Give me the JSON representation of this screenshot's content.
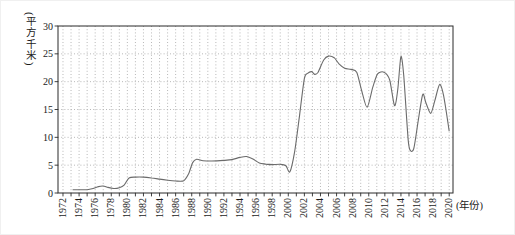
{
  "figure": {
    "ylabel": "(平方千米)",
    "xlabel": "(年份)"
  },
  "colors": {
    "background": "#ffffff",
    "axis": "#2b2b2b",
    "grid": "#b0b0b0",
    "text": "#1a1a1a",
    "line": "#6b6b6b"
  },
  "chart_data": {
    "type": "line",
    "title": "",
    "xlabel": "(年份)",
    "ylabel": "(平方千米)",
    "legend_position": "none",
    "grid": {
      "style": "dotted",
      "vertical_every_years": 1,
      "horizontal_every": 5
    },
    "xlim": [
      1971.38,
      2020.47
    ],
    "ylim": [
      0,
      30
    ],
    "y_ticks": [
      0,
      5,
      10,
      15,
      20,
      25,
      30
    ],
    "x_tick_years_start": 1972,
    "x_tick_years_end": 2020,
    "x_tick_label_step": 2,
    "x_tick_labels": [
      "1972",
      "1974",
      "1976",
      "1978",
      "1980",
      "1982",
      "1984",
      "1986",
      "1988",
      "1990",
      "1992",
      "1994",
      "1996",
      "1998",
      "2000",
      "2002",
      "2004",
      "2006",
      "2008",
      "2010",
      "2012",
      "2014",
      "2016",
      "2018",
      "2020"
    ],
    "points": [
      [
        1973.2,
        0.6
      ],
      [
        1974,
        0.6
      ],
      [
        1975,
        0.6
      ],
      [
        1975.6,
        0.75
      ],
      [
        1976.4,
        1.15
      ],
      [
        1977,
        1.25
      ],
      [
        1977.6,
        1.0
      ],
      [
        1978.3,
        0.8
      ],
      [
        1979,
        0.95
      ],
      [
        1979.6,
        1.4
      ],
      [
        1980.2,
        2.7
      ],
      [
        1981,
        2.85
      ],
      [
        1982,
        2.85
      ],
      [
        1983,
        2.7
      ],
      [
        1984,
        2.5
      ],
      [
        1985,
        2.3
      ],
      [
        1986,
        2.15
      ],
      [
        1987,
        2.2
      ],
      [
        1987.6,
        3.4
      ],
      [
        1988.1,
        5.4
      ],
      [
        1988.6,
        6.05
      ],
      [
        1989.4,
        5.8
      ],
      [
        1990.5,
        5.75
      ],
      [
        1992,
        5.85
      ],
      [
        1993,
        6.0
      ],
      [
        1994,
        6.4
      ],
      [
        1994.8,
        6.55
      ],
      [
        1995.6,
        6.1
      ],
      [
        1996.4,
        5.4
      ],
      [
        1997.2,
        5.2
      ],
      [
        1998,
        5.1
      ],
      [
        1999,
        5.15
      ],
      [
        1999.7,
        4.9
      ],
      [
        2000.2,
        3.8
      ],
      [
        2000.8,
        7.5
      ],
      [
        2001.4,
        14.0
      ],
      [
        2002,
        20.6
      ],
      [
        2002.4,
        21.5
      ],
      [
        2002.9,
        21.8
      ],
      [
        2003.3,
        21.3
      ],
      [
        2003.7,
        21.7
      ],
      [
        2004.4,
        23.9
      ],
      [
        2005,
        24.6
      ],
      [
        2005.7,
        24.3
      ],
      [
        2006.3,
        23.2
      ],
      [
        2007,
        22.4
      ],
      [
        2007.8,
        22.2
      ],
      [
        2008.5,
        21.7
      ],
      [
        2009.1,
        18.5
      ],
      [
        2009.8,
        15.4
      ],
      [
        2010.5,
        19.0
      ],
      [
        2011.1,
        21.4
      ],
      [
        2011.9,
        21.7
      ],
      [
        2012.6,
        20.3
      ],
      [
        2013.2,
        15.7
      ],
      [
        2013.6,
        18.5
      ],
      [
        2014,
        24.5
      ],
      [
        2014.35,
        21.0
      ],
      [
        2014.9,
        9.5
      ],
      [
        2015.2,
        7.6
      ],
      [
        2015.6,
        8.0
      ],
      [
        2016.1,
        12.5
      ],
      [
        2016.7,
        17.7
      ],
      [
        2017.1,
        16.2
      ],
      [
        2017.7,
        14.3
      ],
      [
        2018.2,
        16.5
      ],
      [
        2018.8,
        19.5
      ],
      [
        2019.3,
        17.5
      ],
      [
        2020,
        11.1
      ]
    ]
  }
}
